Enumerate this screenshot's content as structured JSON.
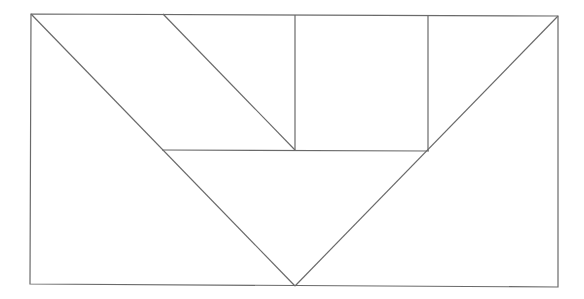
{
  "diagram": {
    "type": "tangram-rectangle",
    "stroke_color": "#6a6a6a",
    "background": "#ffffff",
    "outer_rect": {
      "x1": 31,
      "y1": 14,
      "x2": 558,
      "y2": 286
    },
    "lines": [
      {
        "name": "left-diagonal",
        "x1": 31,
        "y1": 14,
        "x2": 295,
        "y2": 286
      },
      {
        "name": "right-diagonal",
        "x1": 558,
        "y1": 16,
        "x2": 295,
        "y2": 286
      },
      {
        "name": "middle-horizontal",
        "x1": 162,
        "y1": 150,
        "x2": 429,
        "y2": 150
      },
      {
        "name": "parallelogram-diagonal",
        "x1": 163,
        "y1": 14,
        "x2": 295,
        "y2": 150
      },
      {
        "name": "square-left-edge",
        "x1": 295,
        "y1": 15,
        "x2": 295,
        "y2": 150
      },
      {
        "name": "square-right-edge",
        "x1": 428,
        "y1": 15,
        "x2": 428,
        "y2": 150
      }
    ],
    "pieces": [
      "large-triangle-left",
      "large-triangle-right",
      "medium-triangle-top-right",
      "parallelogram",
      "square",
      "inverted-triangle-center"
    ]
  }
}
